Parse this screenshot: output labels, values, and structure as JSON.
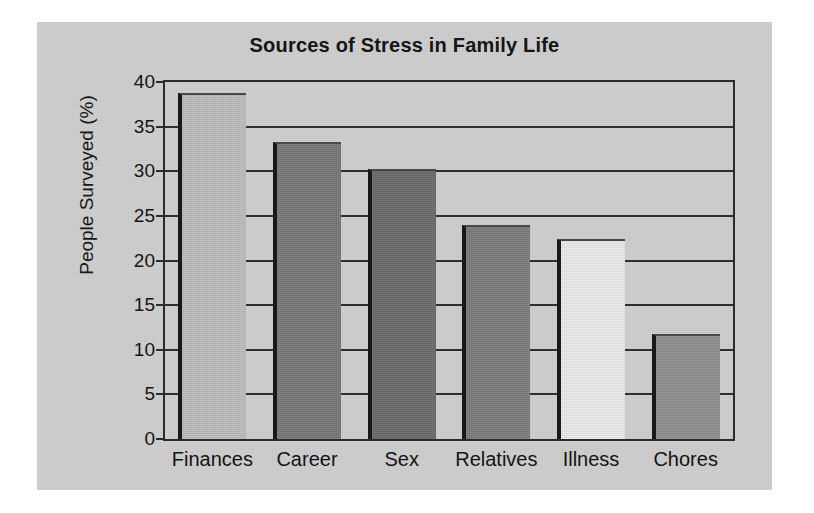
{
  "figure": {
    "background_color": "#cdcdcd",
    "page_color": "#ffffff",
    "axis_color": "#2b2b2b"
  },
  "chart_data": {
    "type": "bar",
    "title": "Sources of Stress in Family Life",
    "xlabel": "",
    "ylabel": "People Surveyed (%)",
    "categories": [
      "Finances",
      "Career",
      "Sex",
      "Relatives",
      "Illness",
      "Chores"
    ],
    "values": [
      38.8,
      33.3,
      30.3,
      24.0,
      22.4,
      11.8
    ],
    "bar_colors": [
      "#bdbdbd",
      "#777777",
      "#6a6a6a",
      "#7b7b7b",
      "#ececec",
      "#8e8e8e"
    ],
    "ylim": [
      0,
      40
    ],
    "yticks": [
      0,
      5,
      10,
      15,
      20,
      25,
      30,
      35,
      40
    ],
    "ytick_labels": [
      "0",
      "5",
      "10",
      "15",
      "20",
      "25",
      "30",
      "35",
      "40"
    ],
    "grid": true,
    "grid_axis": "y",
    "legend": false,
    "legend_position": "none"
  }
}
